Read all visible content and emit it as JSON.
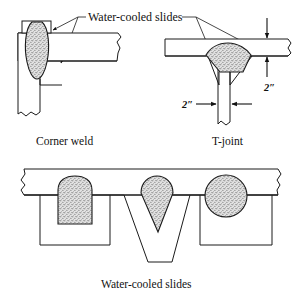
{
  "figure": {
    "title_label": "Water-cooled slides",
    "bottom_label": "Water-cooled slides",
    "captions": {
      "left": "Corner weld",
      "right": "T-joint"
    },
    "dimensions": {
      "plate_thickness": "2″",
      "web_thickness": "2″"
    },
    "colors": {
      "line": "#1a1a1a",
      "metal_fill": "#ffffff",
      "weld_fill": "#d9d9d9",
      "background": "#ffffff"
    },
    "views": [
      {
        "name": "corner-weld",
        "caption": "Corner weld",
        "weld_shape": "vertical-oval-bead",
        "members": [
          "horizontal-plate",
          "vertical-plate"
        ],
        "slides": 2
      },
      {
        "name": "t-joint",
        "caption": "T-joint",
        "weld_shape": "trapezoid-fillet",
        "members": [
          "horizontal-flange",
          "vertical-web"
        ],
        "slides": 2,
        "labeled_dimensions": [
          "2″",
          "2″"
        ]
      },
      {
        "name": "water-cooled-slides-section",
        "caption": "Water-cooled slides",
        "weld_shapes": [
          "dome-square-groove",
          "v-groove-cone",
          "circular-plug"
        ],
        "slide_count": 3
      }
    ]
  }
}
